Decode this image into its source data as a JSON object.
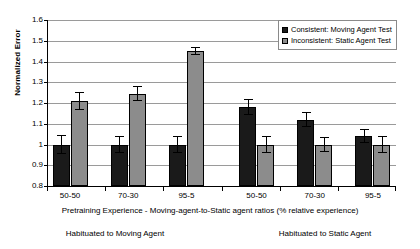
{
  "chart_data": {
    "type": "bar",
    "title": "",
    "xlabel": "Pretraining Experience - Moving-agent-to-Static agent ratios (% relative experience)",
    "ylabel": "Normalized Error",
    "ylim": [
      0.8,
      1.6
    ],
    "ytick_labels": [
      "0.8",
      "0.9",
      "1",
      "1.1",
      "1.2",
      "1.3",
      "1.4",
      "1.5",
      "1.6"
    ],
    "ytick_values": [
      0.8,
      0.9,
      1.0,
      1.1,
      1.2,
      1.3,
      1.4,
      1.5,
      1.6
    ],
    "grid": true,
    "legend_position": "top-right",
    "categories": [
      "50-50",
      "70-30",
      "95-5",
      "50-50",
      "70-30",
      "95-5"
    ],
    "groups": [
      {
        "caption": "Habituated to Moving Agent",
        "categories": [
          "50-50",
          "70-30",
          "95-5"
        ]
      },
      {
        "caption": "Habituated to Static Agent",
        "categories": [
          "50-50",
          "70-30",
          "95-5"
        ]
      }
    ],
    "series": [
      {
        "name": "Consistent: Moving Agent Test",
        "color": "#1a1a1a",
        "values": [
          1.0,
          1.0,
          1.0,
          1.18,
          1.12,
          1.04
        ],
        "errors": [
          0.045,
          0.04,
          0.04,
          0.04,
          0.035,
          0.035
        ]
      },
      {
        "name": "Inconsistent: Static Agent Test",
        "color": "#8c8c8c",
        "values": [
          1.21,
          1.245,
          1.45,
          1.0,
          1.0,
          1.0
        ],
        "errors": [
          0.045,
          0.035,
          0.02,
          0.04,
          0.035,
          0.04
        ]
      }
    ]
  },
  "legend": {
    "items": [
      {
        "label": "Consistent: Moving Agent Test",
        "color": "#1a1a1a"
      },
      {
        "label": "Inconsistent: Static Agent Test",
        "color": "#8c8c8c"
      }
    ]
  },
  "axes": {
    "y_title": "Normalized Error",
    "x_title": "Pretraining Experience - Moving-agent-to-Static agent ratios (% relative experience)"
  },
  "captions": {
    "left": "Habituated to Moving Agent",
    "right": "Habituated to Static Agent"
  }
}
